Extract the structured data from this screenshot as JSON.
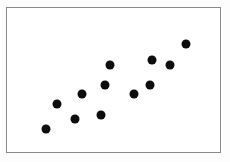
{
  "figure": {
    "background_color": "#fdfdfd",
    "plot_background_color": "#ffffff",
    "frame_color": "#8a8a8a",
    "point_color": "#0d0d0d"
  },
  "chart_data": {
    "type": "scatter",
    "title": "",
    "subtitle": "",
    "xlabel": "",
    "ylabel": "",
    "xlim": [
      0,
      100
    ],
    "ylim": [
      0,
      100
    ],
    "grid": false,
    "legend": null,
    "tick_labels": {
      "x": [],
      "y": []
    },
    "annotations": [],
    "series": [
      {
        "name": "observations",
        "marker": "filled-circle",
        "marker_size_px": 9,
        "color": "#0d0d0d",
        "points": [
          {
            "x": 18.1,
            "y": 15.8
          },
          {
            "x": 23.7,
            "y": 33.6
          },
          {
            "x": 31.9,
            "y": 22.6
          },
          {
            "x": 35.3,
            "y": 40.4
          },
          {
            "x": 44.2,
            "y": 26.0
          },
          {
            "x": 46.0,
            "y": 46.6
          },
          {
            "x": 48.4,
            "y": 60.3
          },
          {
            "x": 59.5,
            "y": 40.4
          },
          {
            "x": 67.0,
            "y": 46.6
          },
          {
            "x": 67.9,
            "y": 63.7
          },
          {
            "x": 76.3,
            "y": 60.3
          },
          {
            "x": 84.2,
            "y": 75.3
          }
        ]
      }
    ]
  }
}
